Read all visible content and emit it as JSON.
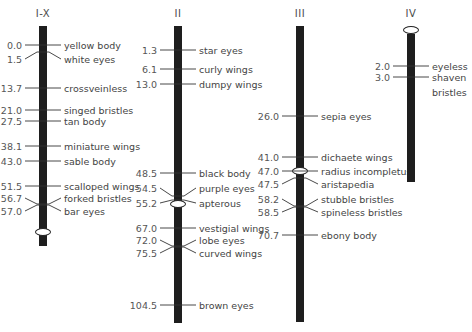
{
  "chromosomes": [
    {
      "name": "I-X",
      "bar": {
        "x": 43,
        "top": 26,
        "bottom": 246
      },
      "centromere_y": 232,
      "loci": [
        {
          "pos": "0.0",
          "gene": "yellow body",
          "y": 45,
          "ly": 45
        },
        {
          "pos": "1.5",
          "gene": "white eyes",
          "y": 52,
          "ly": 59
        },
        {
          "pos": "13.7",
          "gene": "crossveinless",
          "y": 88,
          "ly": 88
        },
        {
          "pos": "21.0",
          "gene": "singed bristles",
          "y": 110,
          "ly": 110
        },
        {
          "pos": "27.5",
          "gene": "tan body",
          "y": 121,
          "ly": 121
        },
        {
          "pos": "38.1",
          "gene": "miniature wings",
          "y": 146,
          "ly": 146
        },
        {
          "pos": "43.0",
          "gene": "sable body",
          "y": 161,
          "ly": 161
        },
        {
          "pos": "51.5",
          "gene": "scalloped wings",
          "y": 186,
          "ly": 186
        },
        {
          "pos": "56.7",
          "gene": "forked bristles",
          "y": 204,
          "ly": 198
        },
        {
          "pos": "57.0",
          "gene": "bar eyes",
          "y": 205,
          "ly": 211
        }
      ]
    },
    {
      "name": "II",
      "bar": {
        "x": 178,
        "top": 26,
        "bottom": 323
      },
      "centromere_y": 204,
      "loci": [
        {
          "pos": "1.3",
          "gene": "star eyes",
          "y": 50,
          "ly": 50
        },
        {
          "pos": "6.1",
          "gene": "curly wings",
          "y": 69,
          "ly": 69
        },
        {
          "pos": "13.0",
          "gene": "dumpy wings",
          "y": 84,
          "ly": 84
        },
        {
          "pos": "48.5",
          "gene": "black body",
          "y": 173,
          "ly": 173
        },
        {
          "pos": "54.5",
          "gene": "purple eyes",
          "y": 196,
          "ly": 188
        },
        {
          "pos": "55.2",
          "gene": "apterous",
          "y": 200,
          "ly": 203
        },
        {
          "pos": "67.0",
          "gene": "vestigial wings",
          "y": 228,
          "ly": 228
        },
        {
          "pos": "72.0",
          "gene": "lobe eyes",
          "y": 246,
          "ly": 240
        },
        {
          "pos": "75.5",
          "gene": "curved wings",
          "y": 247,
          "ly": 253
        },
        {
          "pos": "104.5",
          "gene": "brown eyes",
          "y": 305,
          "ly": 305
        }
      ]
    },
    {
      "name": "III",
      "bar": {
        "x": 300,
        "top": 26,
        "bottom": 322
      },
      "centromere_y": 171,
      "loci": [
        {
          "pos": "26.0",
          "gene": "sepia eyes",
          "y": 116,
          "ly": 116
        },
        {
          "pos": "41.0",
          "gene": "dichaete wings",
          "y": 157,
          "ly": 157
        },
        {
          "pos": "47.0",
          "gene": "radius incompletus",
          "y": 171,
          "ly": 171
        },
        {
          "pos": "47.5",
          "gene": "aristapedia",
          "y": 178,
          "ly": 184
        },
        {
          "pos": "58.2",
          "gene": "stubble bristles",
          "y": 206,
          "ly": 199
        },
        {
          "pos": "58.5",
          "gene": "spineless bristles",
          "y": 207,
          "ly": 212
        },
        {
          "pos": "70.7",
          "gene": "ebony body",
          "y": 235,
          "ly": 235
        }
      ]
    },
    {
      "name": "IV",
      "bar": {
        "x": 411,
        "top": 34,
        "bottom": 182
      },
      "centromere_y": 30,
      "loci": [
        {
          "pos": "2.0",
          "gene": "eyeless",
          "y": 66,
          "ly": 66
        },
        {
          "pos": "3.0",
          "gene": "shaven bristles",
          "y": 77,
          "ly": 77
        }
      ]
    }
  ]
}
